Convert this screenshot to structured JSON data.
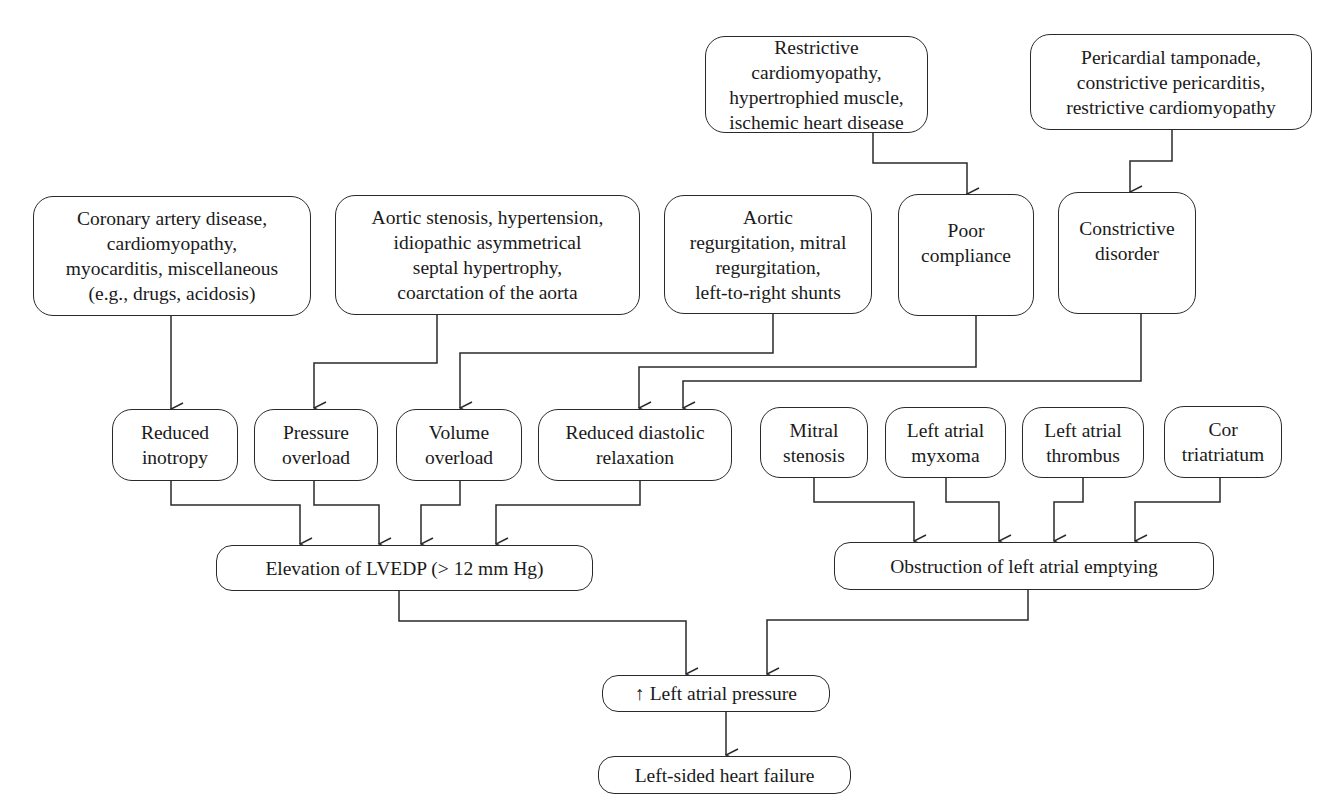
{
  "diagram": {
    "type": "flowchart",
    "title": "",
    "nodes": {
      "restrictive_causes": "Restrictive cardiomyopathy,\nhypertrophied muscle,\nischemic heart disease",
      "pericardial_causes": "Pericardial tamponade,\nconstrictive pericarditis,\nrestrictive cardiomyopathy",
      "coronary_causes": "Coronary artery disease,\ncardiomyopathy,\nmyocarditis, miscellaneous\n(e.g., drugs, acidosis)",
      "aortic_stenosis_causes": "Aortic stenosis, hypertension,\nidiopathic asymmetrical\nseptal hypertrophy,\ncoarctation of the aorta",
      "regurgitation_causes": "Aortic\nregurgitation, mitral\nregurgitation,\nleft-to-right shunts",
      "poor_compliance": "Poor\ncompliance",
      "constrictive_disorder": "Constrictive\ndisorder",
      "reduced_inotropy": "Reduced\ninotropy",
      "pressure_overload": "Pressure\noverload",
      "volume_overload": "Volume\noverload",
      "reduced_diastolic_relaxation": "Reduced diastolic\nrelaxation",
      "mitral_stenosis": "Mitral\nstenosis",
      "left_atrial_myxoma": "Left atrial\nmyxoma",
      "left_atrial_thrombus": "Left atrial\nthrombus",
      "cor_triatriatum": "Cor\ntriatriatum",
      "elevation_lvedp": "Elevation of LVEDP (> 12 mm Hg)",
      "obstruction_la_emptying": "Obstruction of left atrial emptying",
      "increased_la_pressure": "↑ Left atrial pressure",
      "left_sided_heart_failure": "Left-sided heart failure"
    },
    "edges": [
      {
        "from": "restrictive_causes",
        "to": "poor_compliance"
      },
      {
        "from": "pericardial_causes",
        "to": "constrictive_disorder"
      },
      {
        "from": "coronary_causes",
        "to": "reduced_inotropy"
      },
      {
        "from": "aortic_stenosis_causes",
        "to": "pressure_overload"
      },
      {
        "from": "regurgitation_causes",
        "to": "volume_overload"
      },
      {
        "from": "poor_compliance",
        "to": "reduced_diastolic_relaxation"
      },
      {
        "from": "constrictive_disorder",
        "to": "reduced_diastolic_relaxation"
      },
      {
        "from": "reduced_inotropy",
        "to": "elevation_lvedp"
      },
      {
        "from": "pressure_overload",
        "to": "elevation_lvedp"
      },
      {
        "from": "volume_overload",
        "to": "elevation_lvedp"
      },
      {
        "from": "reduced_diastolic_relaxation",
        "to": "elevation_lvedp"
      },
      {
        "from": "mitral_stenosis",
        "to": "obstruction_la_emptying"
      },
      {
        "from": "left_atrial_myxoma",
        "to": "obstruction_la_emptying"
      },
      {
        "from": "left_atrial_thrombus",
        "to": "obstruction_la_emptying"
      },
      {
        "from": "cor_triatriatum",
        "to": "obstruction_la_emptying"
      },
      {
        "from": "elevation_lvedp",
        "to": "increased_la_pressure"
      },
      {
        "from": "obstruction_la_emptying",
        "to": "increased_la_pressure"
      },
      {
        "from": "increased_la_pressure",
        "to": "left_sided_heart_failure"
      }
    ],
    "colors": {
      "stroke": "#2a2a2a",
      "text": "#1a1a1a",
      "background": "#ffffff"
    }
  }
}
